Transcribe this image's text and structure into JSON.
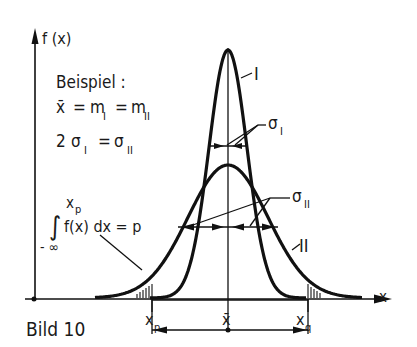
{
  "figure": {
    "caption": "Bild 10",
    "y_axis_label": "f (x)",
    "x_axis_label": "x",
    "example": {
      "heading": "Beispiel :",
      "line1": {
        "xbar": "x̄",
        "eq1": "=",
        "m1": "m",
        "m1_sub": "I",
        "eq2": "=",
        "m2": "m",
        "m2_sub": "II"
      },
      "line2": {
        "factor": "2",
        "s1": "σ",
        "s1_sub": "I",
        "eq": "=",
        "s2": "σ",
        "s2_sub": "II"
      }
    },
    "integral": {
      "upper": "x",
      "upper_sub": "p",
      "lower": "- ∞",
      "body": "f(x) dx = p"
    },
    "curve_labels": {
      "curve1": "I",
      "curve2": "II"
    },
    "sigma_labels": {
      "sigma1": "σ",
      "sigma1_sub": "I",
      "sigma2": "σ",
      "sigma2_sub": "II"
    },
    "x_marks": {
      "xp": "x",
      "xp_sub": "p",
      "xbar": "x̄",
      "xq": "x",
      "xq_sub": "q"
    }
  }
}
